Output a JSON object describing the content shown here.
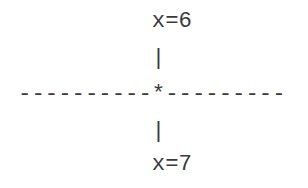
{
  "diagram": {
    "lines": [
      "          x=6",
      "          |",
      "----------*---------",
      "          |",
      "          x=7"
    ],
    "top_label": "x=6",
    "bottom_label": "x=7",
    "center_marker": "*"
  }
}
